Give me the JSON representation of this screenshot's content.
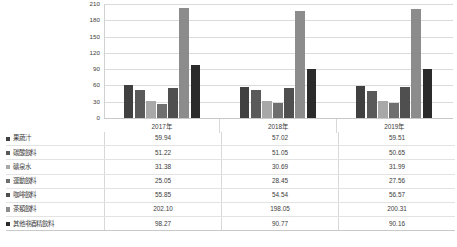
{
  "chart_data": {
    "type": "bar",
    "title": "",
    "xlabel": "",
    "ylabel": "",
    "categories": [
      "2017年",
      "2018年",
      "2019年"
    ],
    "ylim": [
      0,
      210
    ],
    "yticks": [
      210,
      180,
      150,
      120,
      90,
      60,
      30,
      0
    ],
    "grid": true,
    "legend_position": "table-left",
    "series": [
      {
        "name": "果蔬汁",
        "color": "#404040",
        "values": [
          59.94,
          57.02,
          59.51
        ]
      },
      {
        "name": "碳酸飲料",
        "color": "#5a5a5a",
        "values": [
          51.22,
          51.05,
          50.65
        ]
      },
      {
        "name": "礦泉水",
        "color": "#a8a8a8",
        "values": [
          31.38,
          30.69,
          31.99
        ]
      },
      {
        "name": "運動飲料",
        "color": "#6f6f6f",
        "values": [
          25.05,
          28.45,
          27.56
        ]
      },
      {
        "name": "咖啡飲料",
        "color": "#4f4f4f",
        "values": [
          55.85,
          54.54,
          56.57
        ]
      },
      {
        "name": "茶類飲料",
        "color": "#8c8c8c",
        "values": [
          202.1,
          198.05,
          200.31
        ]
      },
      {
        "name": "其他非酒精飲料",
        "color": "#2b2b2b",
        "values": [
          98.27,
          90.77,
          90.16
        ]
      }
    ],
    "table": {
      "rows": [
        {
          "label": "果蔬汁",
          "cells": [
            "59.94",
            "57.02",
            "59.51"
          ]
        },
        {
          "label": "碳酸飲料",
          "cells": [
            "51.22",
            "51.05",
            "50.65"
          ]
        },
        {
          "label": "礦泉水",
          "cells": [
            "31.38",
            "30.69",
            "31.99"
          ]
        },
        {
          "label": "運動飲料",
          "cells": [
            "25.05",
            "28.45",
            "27.56"
          ]
        },
        {
          "label": "咖啡飲料",
          "cells": [
            "55.85",
            "54.54",
            "56.57"
          ]
        },
        {
          "label": "茶類飲料",
          "cells": [
            "202.10",
            "198.05",
            "200.31"
          ]
        },
        {
          "label": "其他非酒精飲料",
          "cells": [
            "98.27",
            "90.77",
            "90.16"
          ]
        }
      ]
    }
  }
}
